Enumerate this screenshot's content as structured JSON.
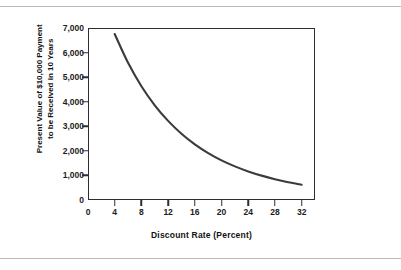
{
  "figure": {
    "background_color": "#ffffff",
    "rule_color": "#b9bcbf",
    "frame_color": "#2e2e2e"
  },
  "chart_data": {
    "type": "line",
    "title": "",
    "subtitle": "",
    "xlabel": "Discount Rate (Percent)",
    "ylabel": "Present Value of $10,000 Payment to be Received in 10 Years",
    "ylabel_line1": "Present Value of $10,000 Payment",
    "ylabel_line2": "to be Received in 10 Years",
    "xlim": [
      0,
      34
    ],
    "ylim": [
      0,
      7000
    ],
    "xticks": [
      0,
      4,
      8,
      12,
      16,
      20,
      24,
      28,
      32
    ],
    "xtick_labels": [
      "0",
      "4",
      "8",
      "12",
      "16",
      "20",
      "24",
      "28",
      "32"
    ],
    "yticks": [
      0,
      1000,
      2000,
      3000,
      4000,
      5000,
      6000,
      7000
    ],
    "ytick_labels": [
      "0",
      "1,000",
      "2,000",
      "3,000",
      "4,000",
      "5,000",
      "6,000",
      "7,000"
    ],
    "grid": false,
    "legend": null,
    "series": [
      {
        "name": "Present value of $10,000 in 10 years",
        "color": "#3b3b3b",
        "line_width": 2.1,
        "x": [
          4,
          6,
          8,
          10,
          12,
          14,
          16,
          18,
          20,
          22,
          24,
          26,
          28,
          30,
          32
        ],
        "values": [
          6756,
          5584,
          4632,
          3855,
          3220,
          2697,
          2267,
          1911,
          1615,
          1369,
          1164,
          992,
          847,
          725,
          623
        ]
      }
    ],
    "annotations": []
  }
}
